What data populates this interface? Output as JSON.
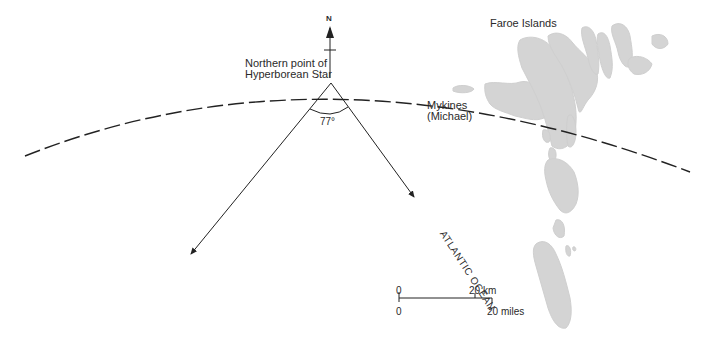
{
  "map": {
    "title": "Faroe Islands",
    "labels": {
      "north": "N",
      "star_point_line1": "Northern point of",
      "star_point_line2": "Hyperborean Star",
      "angle": "77°",
      "mykines_line1": "Mykines",
      "mykines_line2": "(Michael)",
      "ocean": "ATLANTIC   OCEAN"
    },
    "scale_bar": {
      "km_start": "0",
      "km_end": "20 km",
      "miles_start": "0",
      "miles_end": "20 miles"
    },
    "colors": {
      "land": "#d4d4d4",
      "line": "#222222",
      "background": "#ffffff"
    }
  }
}
